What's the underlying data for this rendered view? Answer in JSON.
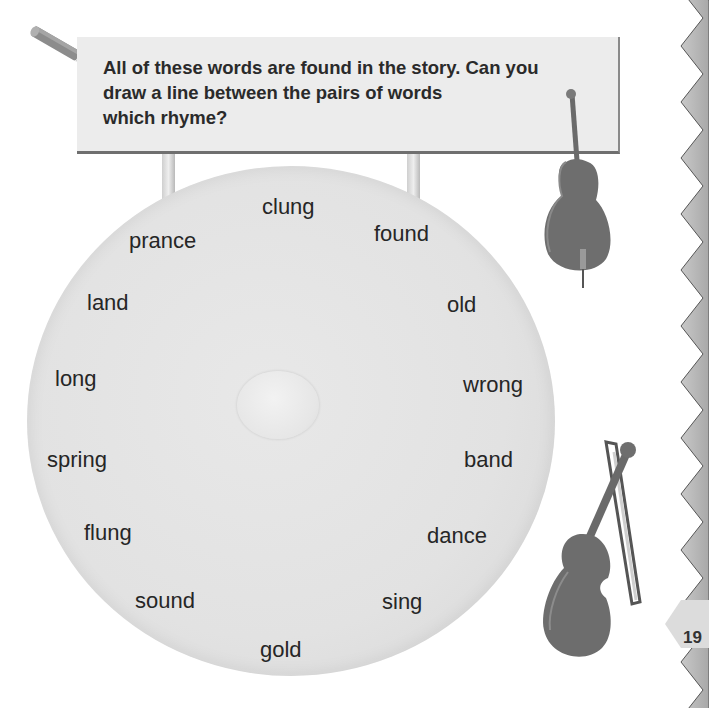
{
  "instruction": {
    "lines": [
      "All of these words are found in the story. Can you",
      "draw a line between the pairs of words",
      "which rhyme?"
    ]
  },
  "words": [
    {
      "text": "clung",
      "x": 262,
      "y": 194
    },
    {
      "text": "prance",
      "x": 129,
      "y": 228
    },
    {
      "text": "found",
      "x": 374,
      "y": 221
    },
    {
      "text": "land",
      "x": 87,
      "y": 290
    },
    {
      "text": "old",
      "x": 447,
      "y": 292
    },
    {
      "text": "long",
      "x": 55,
      "y": 366
    },
    {
      "text": "wrong",
      "x": 463,
      "y": 372
    },
    {
      "text": "spring",
      "x": 47,
      "y": 447
    },
    {
      "text": "band",
      "x": 464,
      "y": 447
    },
    {
      "text": "flung",
      "x": 84,
      "y": 520
    },
    {
      "text": "dance",
      "x": 427,
      "y": 523
    },
    {
      "text": "sound",
      "x": 135,
      "y": 588
    },
    {
      "text": "sing",
      "x": 382,
      "y": 589
    },
    {
      "text": "gold",
      "x": 260,
      "y": 637
    }
  ],
  "page_number": "19",
  "icons": {
    "pencil": "pencil-icon",
    "double_bass": "double-bass-icon",
    "violin": "violin-icon"
  },
  "colors": {
    "sign": "#ececec",
    "gong": "#e2e2e2",
    "zigzag": "#b8b8b8",
    "page_tab": "#d8d8d8",
    "text": "#262626"
  }
}
